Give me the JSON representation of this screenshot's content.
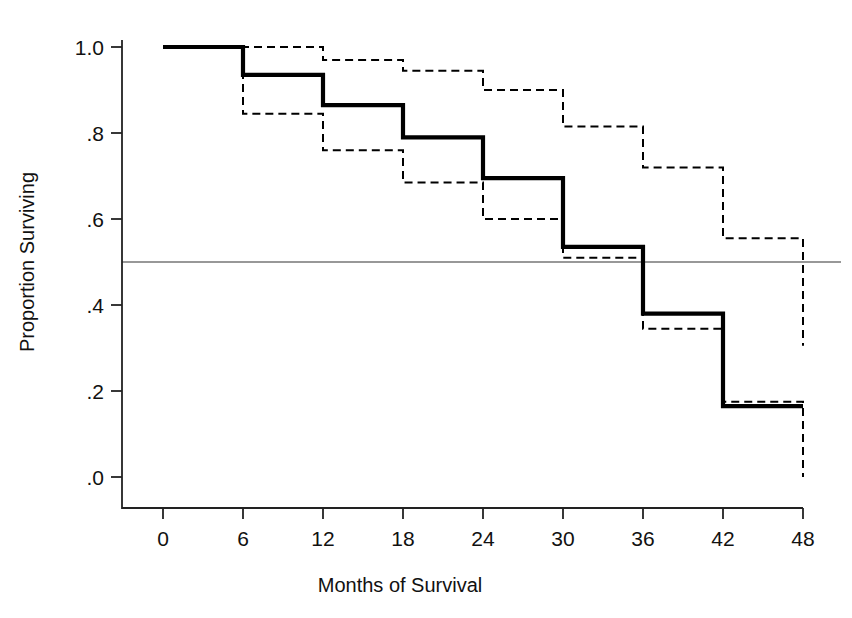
{
  "chart_data": {
    "type": "line",
    "subtype": "kaplan-meier-step",
    "title": "",
    "xlabel": "Months of Survival",
    "ylabel": "Proportion Surviving",
    "xlim": [
      0,
      48
    ],
    "ylim": [
      0.0,
      1.0
    ],
    "xticks": [
      0,
      6,
      12,
      18,
      24,
      30,
      36,
      42,
      48
    ],
    "xtick_labels": [
      "0",
      "6",
      "12",
      "18",
      "24",
      "30",
      "36",
      "42",
      "48"
    ],
    "yticks": [
      0.0,
      0.2,
      0.4,
      0.6,
      0.8,
      1.0
    ],
    "ytick_labels": [
      ".0",
      ".2",
      ".4",
      ".6",
      ".8",
      "1.0"
    ],
    "grid": false,
    "legend": "none",
    "annotations": [
      {
        "name": "median-survival-reference-line",
        "type": "hline",
        "y": 0.5,
        "style": "thin-solid"
      }
    ],
    "series": [
      {
        "name": "Survival estimate",
        "style": "solid-thick",
        "color": "#000000",
        "x": [
          0,
          6,
          12,
          18,
          24,
          30,
          36,
          42,
          48
        ],
        "values": [
          1.0,
          0.935,
          0.865,
          0.79,
          0.695,
          0.535,
          0.38,
          0.165,
          0.165
        ]
      },
      {
        "name": "Upper 95% confidence limit",
        "style": "dashed",
        "color": "#000000",
        "x": [
          0,
          6,
          12,
          18,
          24,
          30,
          36,
          42,
          48
        ],
        "values": [
          1.0,
          1.0,
          0.97,
          0.945,
          0.9,
          0.815,
          0.72,
          0.555,
          0.305
        ]
      },
      {
        "name": "Lower 95% confidence limit",
        "style": "dashed",
        "color": "#000000",
        "x": [
          0,
          6,
          12,
          18,
          24,
          30,
          36,
          42,
          48
        ],
        "values": [
          1.0,
          0.845,
          0.76,
          0.685,
          0.6,
          0.51,
          0.345,
          0.175,
          0.0
        ]
      }
    ]
  }
}
